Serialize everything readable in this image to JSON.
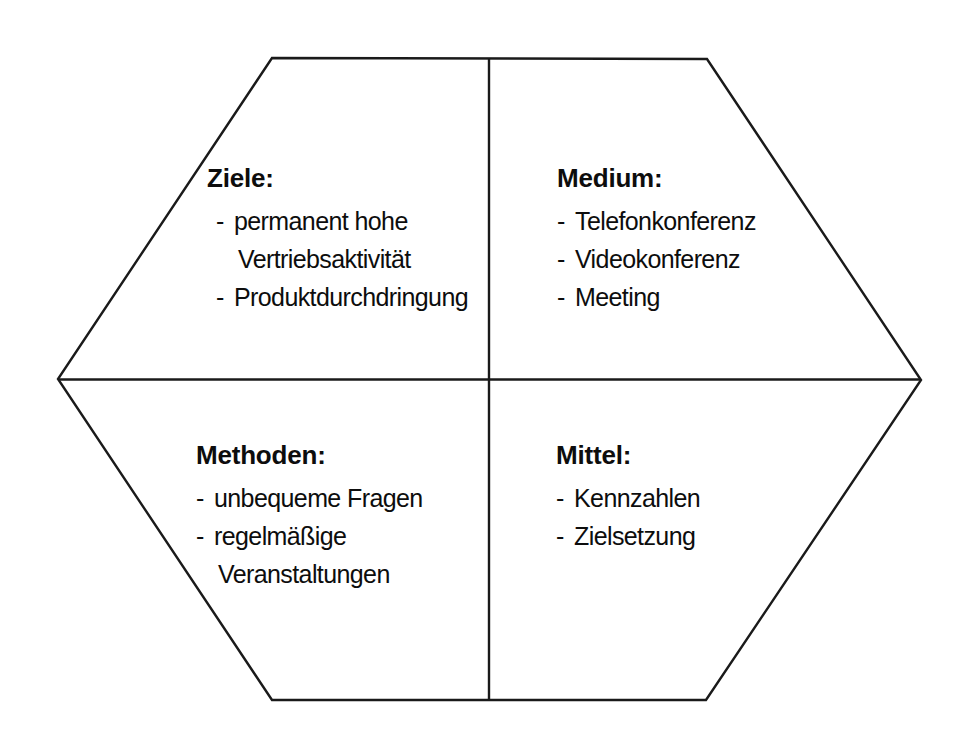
{
  "diagram": {
    "shape": "hexagon",
    "line_color": "#1a1a1a",
    "background_color": "#ffffff",
    "text_color": "#0d0d0d",
    "quadrants": [
      {
        "id": "ziele",
        "position": "top-left",
        "heading": "Ziele:",
        "items": [
          {
            "marker": "-",
            "text": "permanent hohe",
            "continuation": false
          },
          {
            "marker": "",
            "text": "Vertriebsaktivität",
            "continuation": true
          },
          {
            "marker": "-",
            "text": "Produktdurchdringung",
            "continuation": false
          }
        ]
      },
      {
        "id": "medium",
        "position": "top-right",
        "heading": "Medium:",
        "items": [
          {
            "marker": "-",
            "text": "Telefonkonferenz",
            "continuation": false
          },
          {
            "marker": "-",
            "text": "Videokonferenz",
            "continuation": false
          },
          {
            "marker": "-",
            "text": "Meeting",
            "continuation": false
          }
        ]
      },
      {
        "id": "methoden",
        "position": "bottom-left",
        "heading": "Methoden:",
        "items": [
          {
            "marker": "-",
            "text": "unbequeme Fragen",
            "continuation": false
          },
          {
            "marker": "-",
            "text": "regelmäßige",
            "continuation": false
          },
          {
            "marker": "",
            "text": "Veranstaltungen",
            "continuation": true
          }
        ]
      },
      {
        "id": "mittel",
        "position": "bottom-right",
        "heading": "Mittel:",
        "items": [
          {
            "marker": "-",
            "text": "Kennzahlen",
            "continuation": false
          },
          {
            "marker": "-",
            "text": "Zielsetzung",
            "continuation": false
          }
        ]
      }
    ]
  }
}
